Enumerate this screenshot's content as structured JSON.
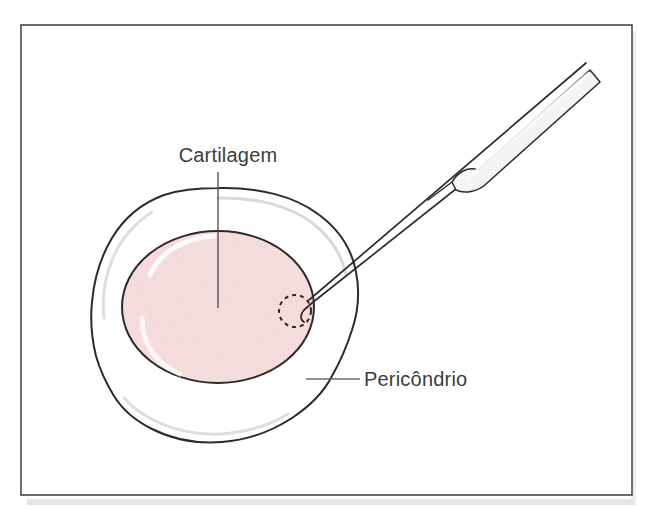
{
  "figure": {
    "kind": "anatomical-illustration",
    "language": "pt-BR",
    "background_color": "#ffffff",
    "frame": {
      "name": "figure-border",
      "x": 21,
      "y": 25,
      "width": 611,
      "height": 470,
      "stroke_color": "#4a4a4a",
      "stroke_width": 1.6,
      "fill": "#ffffff",
      "shadow_color": "#d8d8d8"
    }
  },
  "labels": [
    {
      "id": "cartilagem",
      "text": "Cartilagem",
      "x": 228,
      "y": 162,
      "anchor": "middle",
      "leader": {
        "type": "vertical-line",
        "x1": 218,
        "y1": 172,
        "x2": 218,
        "y2": 308,
        "color": "#4a4a4a"
      }
    },
    {
      "id": "pericondrio",
      "text": "Pericôndrio",
      "x": 364,
      "y": 386,
      "anchor": "start",
      "leader": {
        "type": "horizontal-line",
        "x1": 306,
        "y1": 379,
        "x2": 360,
        "y2": 379,
        "color": "#6b6b6b"
      }
    }
  ],
  "structures": {
    "perichondrium": {
      "name": "perichondrium-outline",
      "fill": "#ffffff",
      "stroke": "#2e2a28",
      "stroke_width": 2.0,
      "highlight_stroke": "#d9d4d2",
      "description": "Irregular lobed outer envelope surrounding the cartilage"
    },
    "cartilage": {
      "name": "cartilage-body",
      "fill": "#f4dcdc",
      "stroke": "#2e2a28",
      "stroke_width": 2.0,
      "highlight_stroke": "#ffffff",
      "center_x": 218,
      "center_y": 307,
      "radius_x": 96,
      "radius_y": 76
    },
    "harvest_site": {
      "name": "dashed-harvest-circle",
      "center_x": 295,
      "center_y": 311,
      "radius": 16,
      "stroke": "#2e2a28",
      "stroke_width": 2.0,
      "dash": "4 4"
    }
  },
  "instrument": {
    "name": "elevator-instrument",
    "type": "periosteal-elevator",
    "shaft_stroke": "#2e2a28",
    "shaft_stroke_width": 1.6,
    "handle_fill": "#f2f2f2",
    "handle_highlight": "#fbfbfb",
    "tip_x": 310,
    "tip_y": 307,
    "tail_x": 596,
    "tail_y": 78
  },
  "colors": {
    "ink": "#2e2a28",
    "text": "#3c3c3c",
    "cartilage_pink": "#f4dcdc",
    "frame_gray": "#4a4a4a",
    "highlight_gray": "#d9d4d2"
  }
}
